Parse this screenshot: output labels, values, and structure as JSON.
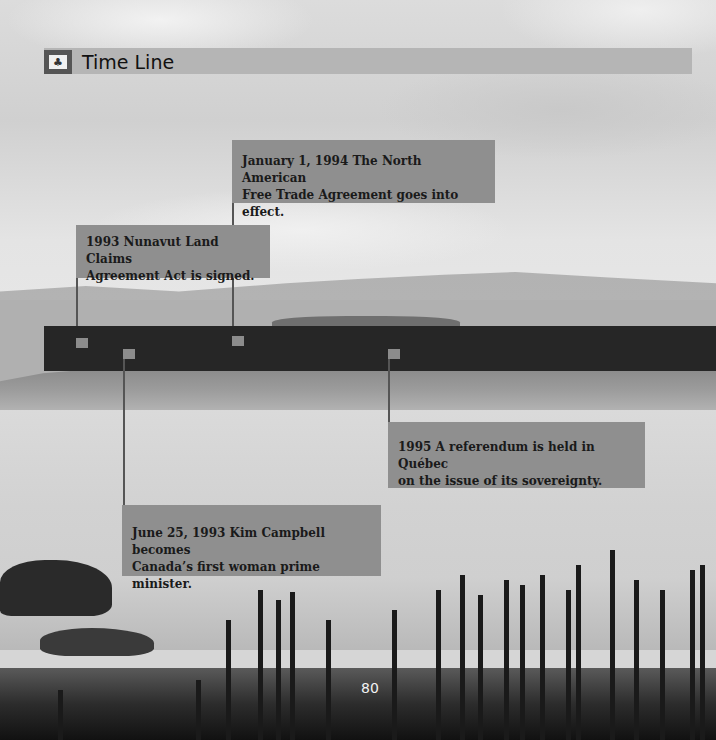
{
  "header": {
    "icon": "maple-leaf-icon",
    "icon_glyph": "♣",
    "title": "Time Line"
  },
  "timeline": {
    "events": [
      {
        "id": "nafta",
        "line1": "January 1, 1994 The North American",
        "line2": "Free Trade Agreement goes into effect.",
        "position": "above"
      },
      {
        "id": "nunavut",
        "line1": "1993 Nunavut Land Claims",
        "line2": "Agreement Act is signed.",
        "position": "above"
      },
      {
        "id": "quebec-referendum",
        "line1": "1995 A referendum is held in Québec",
        "line2": "on the issue of its sovereignty.",
        "position": "below"
      },
      {
        "id": "kim-campbell",
        "line1": "June 25, 1993 Kim Campbell becomes",
        "line2": "Canada’s first woman prime minister.",
        "position": "below"
      }
    ]
  },
  "footer": {
    "page_number": "80"
  },
  "colors": {
    "header_bar": "#b5b5b5",
    "timeline_bar": "#262626",
    "card": "#8f8f8f",
    "marker": "#8c8c8c"
  }
}
